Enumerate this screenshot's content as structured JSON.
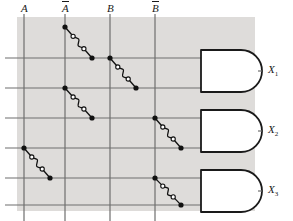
{
  "diagram": {
    "type": "logic-diagram",
    "canvas": {
      "width": 293,
      "height": 221
    },
    "colors": {
      "background": "#ffffff",
      "shade": "#dedcda",
      "wire": "#6e6e6e",
      "gate_stroke": "#1a1a1a",
      "node_fill": "#111111",
      "fuse_circle": "#ffffff",
      "label": "#1a1a1a"
    },
    "shade_region": {
      "x": 17,
      "y": 17,
      "width": 238,
      "height": 194
    }
  },
  "input_columns": [
    {
      "id": "A",
      "label": "A",
      "overbar": false,
      "x": 24,
      "label_x": 21,
      "label_y": 2
    },
    {
      "id": "Abar",
      "label": "A",
      "overbar": true,
      "x": 65,
      "label_x": 62,
      "label_y": 2
    },
    {
      "id": "B",
      "label": "B",
      "overbar": false,
      "x": 110,
      "label_x": 107,
      "label_y": 2
    },
    {
      "id": "Bbar",
      "label": "B",
      "overbar": true,
      "x": 155,
      "label_x": 152,
      "label_y": 2
    }
  ],
  "product_rows": [
    {
      "id": "row1",
      "y": 58,
      "gate": "X1"
    },
    {
      "id": "row2",
      "y": 88,
      "gate": "X1"
    },
    {
      "id": "row3",
      "y": 118,
      "gate": "X2"
    },
    {
      "id": "row4",
      "y": 148,
      "gate": "X2"
    },
    {
      "id": "row5",
      "y": 178,
      "gate": "X3"
    },
    {
      "id": "row6",
      "y": 205,
      "gate": "X3"
    }
  ],
  "fuse_links": [
    {
      "id": "fuse-abar-row1",
      "column": "Abar",
      "row": "row1",
      "x1": 65,
      "y1": 27,
      "x2": 92,
      "y2": 58
    },
    {
      "id": "fuse-b-row2",
      "column": "B",
      "row": "row2",
      "x1": 110,
      "y1": 58,
      "x2": 136,
      "y2": 88
    },
    {
      "id": "fuse-abar-row3",
      "column": "Abar",
      "row": "row3",
      "x1": 65,
      "y1": 88,
      "x2": 92,
      "y2": 118
    },
    {
      "id": "fuse-bbar-row4",
      "column": "Bbar",
      "row": "row4",
      "x1": 155,
      "y1": 118,
      "x2": 181,
      "y2": 148
    },
    {
      "id": "fuse-a-row5",
      "column": "A",
      "row": "row5",
      "x1": 24,
      "y1": 148,
      "x2": 50,
      "y2": 178
    },
    {
      "id": "fuse-bbar-row6",
      "column": "Bbar",
      "row": "row6",
      "x1": 155,
      "y1": 178,
      "x2": 181,
      "y2": 205
    }
  ],
  "gates": [
    {
      "id": "gate-x1",
      "type": "AND",
      "x": 201,
      "y": 50,
      "width": 40,
      "height": 42,
      "output_label": "X",
      "output_sub": "1",
      "label_x": 268,
      "label_y": 64
    },
    {
      "id": "gate-x2",
      "type": "AND",
      "x": 201,
      "y": 110,
      "width": 40,
      "height": 42,
      "output_label": "X",
      "output_sub": "2",
      "label_x": 268,
      "label_y": 124
    },
    {
      "id": "gate-x3",
      "type": "AND",
      "x": 201,
      "y": 170,
      "width": 40,
      "height": 42,
      "output_label": "X",
      "output_sub": "3",
      "label_x": 268,
      "label_y": 184
    }
  ],
  "outputs": [
    {
      "id": "X1",
      "label": "X",
      "sub": "1"
    },
    {
      "id": "X2",
      "label": "X",
      "sub": "2"
    },
    {
      "id": "X3",
      "label": "X",
      "sub": "3"
    }
  ]
}
